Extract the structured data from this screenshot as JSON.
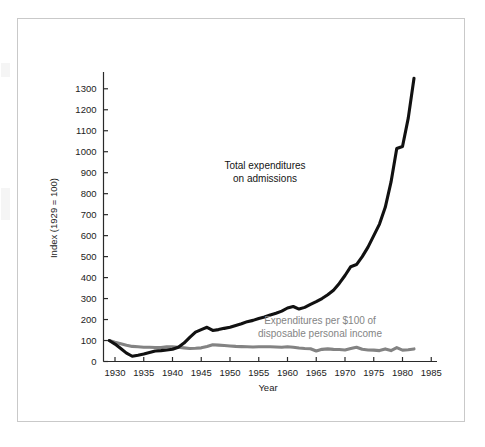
{
  "figure": {
    "frame_color": "#c9c9c9",
    "background": "#ffffff"
  },
  "axes": {
    "y_title": "Index (1929 = 100)",
    "x_title": "Year",
    "y_ticks": [
      "0",
      "100",
      "200",
      "300",
      "400",
      "500",
      "600",
      "700",
      "800",
      "900",
      "1000",
      "1100",
      "1200",
      "1300"
    ],
    "x_ticks": [
      "1930",
      "1935",
      "1940",
      "1945",
      "1950",
      "1955",
      "1960",
      "1965",
      "1970",
      "1975",
      "1980",
      "1985"
    ]
  },
  "annotations": {
    "total_line_1": "Total expenditures",
    "total_line_2": "on admissions",
    "share_line_1": "Expenditures per $100 of",
    "share_line_2": "disposable personal income"
  },
  "chart_data": {
    "type": "line",
    "title": "",
    "xlabel": "Year",
    "ylabel": "Index (1929 = 100)",
    "xlim": [
      1928,
      1986
    ],
    "ylim": [
      0,
      1380
    ],
    "grid": false,
    "legend": "annotated-inline",
    "y_ticks": [
      0,
      100,
      200,
      300,
      400,
      500,
      600,
      700,
      800,
      900,
      1000,
      1100,
      1200,
      1300
    ],
    "x_ticks": [
      1930,
      1935,
      1940,
      1945,
      1950,
      1955,
      1960,
      1965,
      1970,
      1975,
      1980,
      1985
    ],
    "series": [
      {
        "name": "Total expenditures on admissions",
        "color": "#111111",
        "width": 3.1,
        "x": [
          1929,
          1930,
          1931,
          1932,
          1933,
          1934,
          1935,
          1936,
          1937,
          1938,
          1939,
          1940,
          1941,
          1942,
          1943,
          1944,
          1945,
          1946,
          1947,
          1948,
          1949,
          1950,
          1951,
          1952,
          1953,
          1954,
          1955,
          1956,
          1957,
          1958,
          1959,
          1960,
          1961,
          1962,
          1963,
          1964,
          1965,
          1966,
          1967,
          1968,
          1969,
          1970,
          1971,
          1972,
          1973,
          1974,
          1975,
          1976,
          1977,
          1978,
          1979,
          1980,
          1981,
          1982
        ],
        "y": [
          100,
          83,
          62,
          40,
          25,
          30,
          36,
          43,
          50,
          52,
          55,
          58,
          68,
          88,
          115,
          140,
          152,
          163,
          148,
          152,
          158,
          163,
          172,
          180,
          190,
          196,
          205,
          212,
          222,
          230,
          240,
          255,
          262,
          250,
          258,
          272,
          285,
          300,
          318,
          340,
          372,
          410,
          452,
          462,
          500,
          545,
          600,
          655,
          735,
          855,
          1015,
          1025,
          1160,
          1350
        ]
      },
      {
        "name": "Expenditures per $100 of disposable personal income",
        "color": "#838383",
        "width": 3.1,
        "x": [
          1929,
          1930,
          1931,
          1932,
          1933,
          1934,
          1935,
          1936,
          1937,
          1938,
          1939,
          1940,
          1941,
          1942,
          1943,
          1944,
          1945,
          1946,
          1947,
          1948,
          1949,
          1950,
          1951,
          1952,
          1953,
          1954,
          1955,
          1956,
          1957,
          1958,
          1959,
          1960,
          1961,
          1962,
          1963,
          1964,
          1965,
          1966,
          1967,
          1968,
          1969,
          1970,
          1971,
          1972,
          1973,
          1974,
          1975,
          1976,
          1977,
          1978,
          1979,
          1980,
          1981,
          1982
        ],
        "y": [
          100,
          92,
          85,
          78,
          72,
          70,
          68,
          68,
          67,
          66,
          70,
          70,
          68,
          65,
          62,
          63,
          65,
          72,
          80,
          78,
          76,
          74,
          72,
          71,
          70,
          69,
          70,
          70,
          70,
          69,
          68,
          70,
          68,
          64,
          62,
          61,
          50,
          58,
          60,
          58,
          57,
          55,
          62,
          68,
          58,
          55,
          54,
          52,
          60,
          52,
          66,
          54,
          56,
          60
        ]
      }
    ]
  }
}
